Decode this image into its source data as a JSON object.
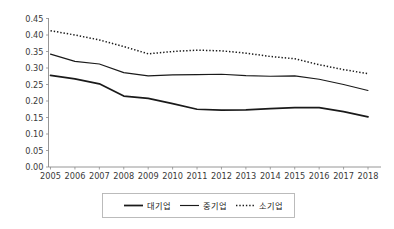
{
  "chart_data": {
    "type": "line",
    "title": "",
    "subtitle": "",
    "xlabel": "",
    "ylabel": "",
    "categories": [
      "2005",
      "2006",
      "2007",
      "2008",
      "2009",
      "2010",
      "2011",
      "2012",
      "2013",
      "2014",
      "2015",
      "2016",
      "2017",
      "2018"
    ],
    "x": [
      2005,
      2006,
      2007,
      2008,
      2009,
      2010,
      2011,
      2012,
      2013,
      2014,
      2015,
      2016,
      2017,
      2018
    ],
    "ylim": [
      0.0,
      0.45
    ],
    "yticks": [
      "0.00",
      "0.05",
      "0.10",
      "0.15",
      "0.20",
      "0.25",
      "0.30",
      "0.35",
      "0.40",
      "0.45"
    ],
    "ytick_values": [
      0.0,
      0.05,
      0.1,
      0.15,
      0.2,
      0.25,
      0.3,
      0.35,
      0.4,
      0.45
    ],
    "grid": false,
    "legend_position": "bottom",
    "series": [
      {
        "name": "대기업",
        "style": "solid-thick",
        "values": [
          0.278,
          0.267,
          0.252,
          0.215,
          0.208,
          0.192,
          0.175,
          0.172,
          0.173,
          0.177,
          0.18,
          0.18,
          0.168,
          0.152
        ]
      },
      {
        "name": "중기업",
        "style": "solid-thin",
        "values": [
          0.342,
          0.32,
          0.312,
          0.286,
          0.276,
          0.279,
          0.28,
          0.281,
          0.277,
          0.275,
          0.276,
          0.266,
          0.25,
          0.232
        ]
      },
      {
        "name": "소기업",
        "style": "dotted",
        "values": [
          0.413,
          0.4,
          0.385,
          0.365,
          0.343,
          0.35,
          0.354,
          0.352,
          0.345,
          0.335,
          0.328,
          0.31,
          0.295,
          0.283
        ]
      }
    ]
  },
  "legend": {
    "entries": [
      {
        "label": "대기업"
      },
      {
        "label": "중기업"
      },
      {
        "label": "소기업"
      }
    ]
  },
  "colors": {
    "line": "#1a1a1a",
    "axis": "#8a8a8a",
    "text": "#3a3a3a",
    "background": "#ffffff",
    "legend_border": "#b4b4b4"
  }
}
